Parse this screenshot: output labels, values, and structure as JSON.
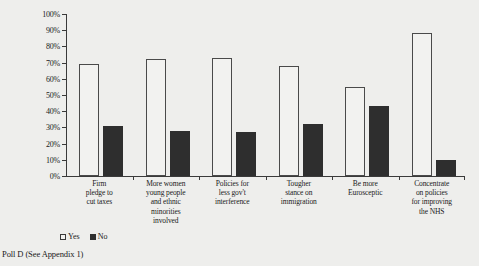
{
  "chart_data": {
    "type": "bar",
    "title": "",
    "xlabel": "",
    "ylabel": "",
    "ylim": [
      0,
      100
    ],
    "grid": false,
    "legend_position": "bottom-left",
    "categories": [
      "Firm pledge to cut taxes",
      "More women young people and ethnic minorities involved",
      "Policies for less gov't interference",
      "Tougher stance on immigration",
      "Be more Eurosceptic",
      "Concentrate on policies for improving the NHS"
    ],
    "category_lines": [
      [
        "Firm",
        "pledge to",
        "cut taxes"
      ],
      [
        "More women",
        "young people",
        "and ethnic",
        "minorities",
        "involved"
      ],
      [
        "Policies for",
        "less gov't",
        "interference"
      ],
      [
        "Tougher",
        "stance on",
        "immigration"
      ],
      [
        "Be more",
        "Eurosceptic"
      ],
      [
        "Concentrate",
        "on policies",
        "for improving",
        "the NHS"
      ]
    ],
    "series": [
      {
        "name": "Yes",
        "color": "#f2f2f0",
        "values": [
          69,
          72,
          73,
          68,
          55,
          88
        ]
      },
      {
        "name": "No",
        "color": "#2e2e2e",
        "values": [
          31,
          28,
          27,
          32,
          43,
          10
        ]
      }
    ],
    "ytick_labels": [
      "100%",
      "90%",
      "80%",
      "70%",
      "60%",
      "50%",
      "40%",
      "30%",
      "20%",
      "10%",
      "0%"
    ],
    "ytick_values": [
      100,
      90,
      80,
      70,
      60,
      50,
      40,
      30,
      20,
      10,
      0
    ]
  },
  "legend": {
    "items": [
      {
        "label": "Yes",
        "key": "yes"
      },
      {
        "label": "No",
        "key": "no"
      }
    ]
  },
  "footer": {
    "caption": "Poll D (See Appendix 1)"
  }
}
